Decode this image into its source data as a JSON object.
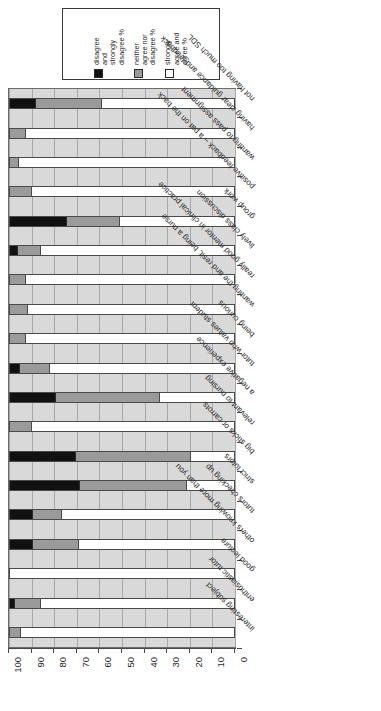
{
  "legend": {
    "title": "",
    "items": [
      {
        "label": "disagree\nand\nstrongly\ndisagree %",
        "color": "#111111",
        "key": "negative"
      },
      {
        "label": "neither\nagree nor\ndisagree %",
        "color": "#9a9a9a",
        "key": "neutral"
      },
      {
        "label": "strongly\nagree and\nagree %",
        "color": "#ffffff",
        "key": "positive"
      }
    ]
  },
  "axis": {
    "ticks": [
      "100",
      "90",
      "80",
      "70",
      "60",
      "50",
      "40",
      "30",
      "20",
      "10",
      "0"
    ],
    "min": 0,
    "max": 100,
    "direction": "reversed"
  },
  "chart_data": {
    "type": "bar",
    "orientation": "horizontal-stacked",
    "title": "",
    "xlabel": "",
    "ylabel": "",
    "xlim": [
      0,
      100
    ],
    "grid": true,
    "legend_position": "top",
    "stacked": true,
    "categories": [
      "not having too much SDL",
      "having clear guidance and feedback",
      "wanting to pass assignment",
      "positive feedback – a pat on the back",
      "group work",
      "lively class discussion",
      "really good mentor in clinical practice",
      "wanting the and resit, being a nurse",
      "being curious",
      "tutor who values student",
      "a negative experience",
      "relevant to nursing",
      "big sticks or carrots",
      "strict tutors",
      "tutors checking up",
      "others knowing more than you",
      "good lecture",
      "enthusiastic tutor",
      "interesting subject"
    ],
    "series": [
      {
        "name": "disagree and strongly disagree %",
        "color": "#111111",
        "values": [
          11,
          0,
          0,
          0,
          25,
          3,
          0,
          0,
          0,
          4,
          20,
          0,
          29,
          31,
          10,
          10,
          0,
          2,
          0
        ]
      },
      {
        "name": "neither agree nor disagree %",
        "color": "#9a9a9a",
        "values": [
          30,
          7,
          4,
          10,
          24,
          11,
          7,
          8,
          7,
          14,
          47,
          10,
          52,
          48,
          13,
          21,
          0,
          12,
          5
        ]
      },
      {
        "name": "strongly agree and agree %",
        "color": "#ffffff",
        "values": [
          59,
          93,
          96,
          90,
          51,
          86,
          93,
          92,
          93,
          82,
          33,
          90,
          19,
          21,
          77,
          69,
          100,
          86,
          95
        ]
      }
    ]
  }
}
